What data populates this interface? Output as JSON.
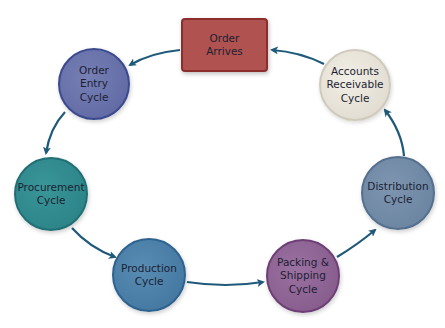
{
  "diagram": {
    "type": "cycle",
    "nodes": [
      {
        "id": "order-arrives",
        "label": "Order\nArrives",
        "shape": "rounded-rect",
        "color": "#b0524f",
        "border": "#8c2f2c",
        "x": 181,
        "y": 18,
        "w": 87,
        "h": 54
      },
      {
        "id": "order-entry",
        "label": "Order\nEntry\nCycle",
        "shape": "circle",
        "color": "#6670a8",
        "border": "#3b4a8e",
        "cx": 94,
        "cy": 84,
        "r": 36
      },
      {
        "id": "procurement",
        "label": "Procurement\nCycle",
        "shape": "circle",
        "color": "#2f8a8c",
        "border": "#216f74",
        "cx": 51,
        "cy": 194,
        "r": 37
      },
      {
        "id": "production",
        "label": "Production\nCycle",
        "shape": "circle",
        "color": "#4a7fa8",
        "border": "#2e6390",
        "cx": 149,
        "cy": 275,
        "r": 37
      },
      {
        "id": "packing-shipping",
        "label": "Packing &\nShipping\nCycle",
        "shape": "circle",
        "color": "#8e6392",
        "border": "#6e3f76",
        "cx": 303,
        "cy": 276,
        "r": 37
      },
      {
        "id": "distribution",
        "label": "Distribution\nCycle",
        "shape": "circle",
        "color": "#7189a6",
        "border": "#55708f",
        "cx": 398,
        "cy": 193,
        "r": 37
      },
      {
        "id": "accounts-receivable",
        "label": "Accounts\nReceivable\nCycle",
        "shape": "circle",
        "color": "#e7e3d9",
        "border": "#cfcabc",
        "cx": 355,
        "cy": 85,
        "r": 36
      }
    ],
    "edges": [
      {
        "from": "order-arrives",
        "to": "order-entry"
      },
      {
        "from": "order-entry",
        "to": "procurement"
      },
      {
        "from": "procurement",
        "to": "production"
      },
      {
        "from": "production",
        "to": "packing-shipping"
      },
      {
        "from": "packing-shipping",
        "to": "distribution"
      },
      {
        "from": "distribution",
        "to": "accounts-receivable"
      },
      {
        "from": "accounts-receivable",
        "to": "order-arrives"
      }
    ],
    "arrow_color": "#1f5a7a"
  }
}
